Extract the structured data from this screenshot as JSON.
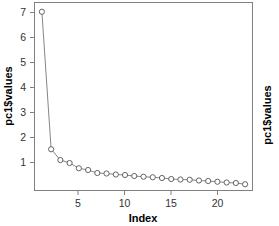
{
  "chart_data": {
    "type": "line",
    "title": "",
    "subtitle": "",
    "xlabel": "Index",
    "ylabel": "pc1$values",
    "ylabel_right": "pc1$values",
    "x": [
      1,
      2,
      3,
      4,
      5,
      6,
      7,
      8,
      9,
      10,
      11,
      12,
      13,
      14,
      15,
      16,
      17,
      18,
      19,
      20,
      21,
      22,
      23
    ],
    "values": [
      7.25,
      1.75,
      1.32,
      1.2,
      0.99,
      0.92,
      0.8,
      0.78,
      0.74,
      0.72,
      0.68,
      0.65,
      0.63,
      0.6,
      0.56,
      0.54,
      0.53,
      0.5,
      0.48,
      0.45,
      0.42,
      0.4,
      0.35
    ],
    "series": [
      {
        "name": "pc1$values",
        "values": [
          7.25,
          1.75,
          1.32,
          1.2,
          0.99,
          0.92,
          0.8,
          0.78,
          0.74,
          0.72,
          0.68,
          0.65,
          0.63,
          0.6,
          0.56,
          0.54,
          0.53,
          0.5,
          0.48,
          0.45,
          0.42,
          0.4,
          0.35
        ]
      }
    ],
    "xticks": [
      5,
      10,
      15,
      20
    ],
    "xtick_labels": [
      "5",
      "10",
      "15",
      "20"
    ],
    "yticks": [
      1,
      2,
      3,
      4,
      5,
      6,
      7
    ],
    "ytick_labels": [
      "1",
      "2",
      "3",
      "4",
      "5",
      "6",
      "7"
    ],
    "xlim": [
      0.2,
      23.8
    ],
    "ylim": [
      0.1,
      7.62
    ],
    "grid": false,
    "legend": null,
    "marker": "open-circle",
    "line_color": "#777777",
    "marker_color": "#555555",
    "frame_color": "#808080",
    "background": "#ffffff"
  }
}
